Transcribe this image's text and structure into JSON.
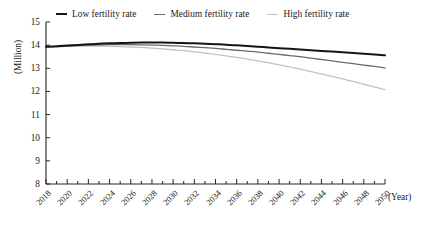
{
  "chart_data": {
    "type": "line",
    "title": "",
    "xlabel": "(Year)",
    "ylabel": "(Million)",
    "xlim": [
      2018,
      2050
    ],
    "ylim": [
      8,
      15
    ],
    "grid": false,
    "legend_position": "top",
    "y_ticks": [
      15,
      14,
      13,
      12,
      11,
      10,
      9,
      8
    ],
    "x_ticks": [
      2018,
      2020,
      2022,
      2024,
      2026,
      2028,
      2030,
      2032,
      2034,
      2036,
      2038,
      2040,
      2042,
      2044,
      2046,
      2048,
      2050
    ],
    "x_tick_interval_minor": 1,
    "x": [
      2018,
      2019,
      2020,
      2021,
      2022,
      2023,
      2024,
      2025,
      2026,
      2027,
      2028,
      2029,
      2030,
      2031,
      2032,
      2033,
      2034,
      2035,
      2036,
      2037,
      2038,
      2039,
      2040,
      2041,
      2042,
      2043,
      2044,
      2045,
      2046,
      2047,
      2048,
      2049,
      2050
    ],
    "series": [
      {
        "name": "Low fertility rate",
        "color": "#141414",
        "width": 2.0,
        "values": [
          13.93,
          13.95,
          13.98,
          14.01,
          14.04,
          14.06,
          14.08,
          14.09,
          14.1,
          14.11,
          14.11,
          14.11,
          14.1,
          14.09,
          14.08,
          14.06,
          14.04,
          14.02,
          13.99,
          13.96,
          13.93,
          13.9,
          13.87,
          13.84,
          13.81,
          13.78,
          13.75,
          13.72,
          13.69,
          13.66,
          13.63,
          13.6,
          13.56
        ]
      },
      {
        "name": "Medium fertility rate",
        "color": "#6b6b6b",
        "width": 1.3,
        "values": [
          13.93,
          13.94,
          13.96,
          13.98,
          14.0,
          14.01,
          14.02,
          14.02,
          14.02,
          14.01,
          14.0,
          13.99,
          13.97,
          13.95,
          13.92,
          13.89,
          13.86,
          13.82,
          13.78,
          13.74,
          13.7,
          13.65,
          13.6,
          13.55,
          13.5,
          13.44,
          13.38,
          13.32,
          13.26,
          13.2,
          13.14,
          13.08,
          13.02
        ]
      },
      {
        "name": "High fertility rate",
        "color": "#c2c2c2",
        "width": 1.3,
        "values": [
          13.93,
          13.94,
          13.95,
          13.96,
          13.96,
          13.96,
          13.95,
          13.94,
          13.92,
          13.9,
          13.87,
          13.84,
          13.8,
          13.76,
          13.71,
          13.66,
          13.6,
          13.54,
          13.47,
          13.4,
          13.32,
          13.24,
          13.15,
          13.06,
          12.96,
          12.86,
          12.76,
          12.65,
          12.54,
          12.43,
          12.31,
          12.2,
          12.08
        ]
      }
    ]
  },
  "legend": {
    "items": [
      {
        "label": "Low fertility rate",
        "color": "#141414",
        "marker": "line-marker-thick"
      },
      {
        "label": "Medium fertility rate",
        "color": "#6b6b6b",
        "marker": "line-marker-medium"
      },
      {
        "label": "High fertility rate",
        "color": "#c2c2c2",
        "marker": "line-marker-light"
      }
    ]
  },
  "axes": {
    "y_title": "(Million)",
    "x_title": "(Year)"
  }
}
